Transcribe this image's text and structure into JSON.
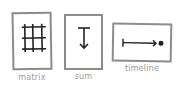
{
  "cards": [
    {
      "id": "matrix",
      "label": "matrix",
      "icon": "grid-icon"
    },
    {
      "id": "sum",
      "label": "sum",
      "icon": "sum-arrow-icon"
    },
    {
      "id": "timeline",
      "label": "timeline",
      "icon": "timeline-icon"
    }
  ],
  "colors": {
    "border": "#8c8c8c",
    "icon": "#222222",
    "label": "#9a9a9a"
  }
}
